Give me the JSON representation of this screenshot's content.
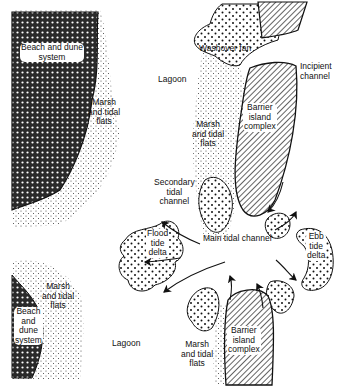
{
  "figure": {
    "colors": {
      "ink": "#111111",
      "background": "#ffffff"
    },
    "fill_patterns": {
      "beach_dune": "crosshatch",
      "barrier_island": "diagonal-hatch",
      "marsh_flats": "fine-stipple",
      "deltas_fans": "coarse-dots"
    }
  },
  "labels": {
    "beach_dune_top": "Beach and dune\nsystem",
    "marsh_left_top": "Marsh\nand tidal\nflats",
    "lagoon_top": "Lagoon",
    "washover_fan": "Washover fan",
    "incipient_channel": "Incipient\nchannel",
    "marsh_center_top": "Marsh\nand tidal\nflats",
    "barrier_top": "Barrier\nisland\ncomplex",
    "secondary_channel": "Secondary\ntidal\nchannel",
    "flood_delta": "Flood\ntide\ndelta",
    "main_channel": "Main tidal channel",
    "ebb_delta": "Ebb\ntide\ndelta",
    "marsh_left_bottom": "Marsh\nand tidal\nflats",
    "beach_dune_bottom": "Beach\nand\ndune\nsystem",
    "lagoon_bottom": "Lagoon",
    "marsh_center_bottom": "Marsh\nand tidal\nflats",
    "barrier_bottom": "Barrier\nisland\ncomplex"
  }
}
